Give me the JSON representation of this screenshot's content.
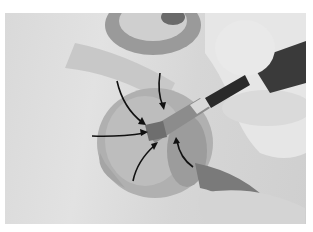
{
  "image": {
    "description": "Grayscale photograph of a hand holding a paintbrush painting the center of a flower (iris-like) in watercolor, with black curved arrows pointing toward the flower's center",
    "subject": "painting demonstration",
    "arrows_count": 6,
    "palette": {
      "background": "#ffffff",
      "paper": "#dcdcdc",
      "petal": "#b5b5b5",
      "shadow": "#6e6e6e",
      "dark": "#2a2a2a",
      "arrow": "#111111"
    }
  }
}
